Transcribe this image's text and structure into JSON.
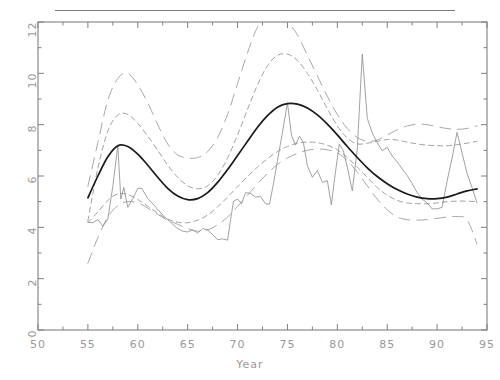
{
  "figure": {
    "top_rule": true,
    "background_color": "#ffffff",
    "frame_color": "#808080",
    "tick_label_color": "#9a9a9a"
  },
  "chart_data": {
    "type": "line",
    "title": "",
    "subtitle": "",
    "xlabel": "Year",
    "ylabel": "",
    "xlim": [
      50,
      95
    ],
    "ylim": [
      0,
      12
    ],
    "xticks": [
      50,
      55,
      60,
      65,
      70,
      75,
      80,
      85,
      90,
      95
    ],
    "xtick_labels": [
      "50",
      "55",
      "60",
      "65",
      "70",
      "75",
      "80",
      "85",
      "90",
      "95"
    ],
    "yticks": [
      0,
      2,
      4,
      6,
      8,
      10,
      12
    ],
    "ytick_labels": [
      "0",
      "2",
      "4",
      "6",
      "8",
      "10",
      "12"
    ],
    "minor_xticks": [
      52.5,
      57.5,
      62.5,
      67.5,
      72.5,
      77.5,
      82.5,
      87.5,
      92.5
    ],
    "minor_yticks": [
      1,
      3,
      5,
      7,
      9,
      11
    ],
    "grid": false,
    "legend": null,
    "series": [
      {
        "name": "smooth trend",
        "style": "solid",
        "color": "#1a1a1a",
        "width": 1.7,
        "x": [
          55,
          56,
          57,
          58,
          59,
          60,
          61,
          62,
          63,
          64,
          65,
          66,
          67,
          68,
          69,
          70,
          71,
          72,
          73,
          74,
          75,
          76,
          77,
          78,
          79,
          80,
          81,
          82,
          83,
          84,
          85,
          86,
          87,
          88,
          89,
          90,
          91,
          92,
          93,
          94
        ],
        "values": [
          5.15,
          6.0,
          6.75,
          7.18,
          7.15,
          6.85,
          6.42,
          5.95,
          5.52,
          5.22,
          5.08,
          5.12,
          5.35,
          5.75,
          6.25,
          6.8,
          7.35,
          7.9,
          8.35,
          8.68,
          8.82,
          8.8,
          8.65,
          8.38,
          8.02,
          7.6,
          7.15,
          6.72,
          6.32,
          5.98,
          5.7,
          5.47,
          5.3,
          5.18,
          5.12,
          5.12,
          5.18,
          5.3,
          5.42,
          5.5
        ]
      },
      {
        "name": "observed data",
        "style": "solid",
        "color": "#8a8a8a",
        "width": 0.8,
        "x": [
          55,
          55.5,
          56,
          56.5,
          57,
          57.5,
          58,
          58.3,
          58.6,
          59,
          59.5,
          60,
          60.4,
          61,
          61.5,
          62,
          62.5,
          63,
          63.5,
          64,
          64.5,
          65,
          65.5,
          66,
          66.5,
          67,
          67.5,
          68,
          68.5,
          69,
          69.3,
          69.6,
          70,
          70.4,
          70.8,
          71.3,
          71.8,
          72.3,
          72.8,
          73.2,
          73.6,
          74,
          74.5,
          75,
          75.4,
          75.8,
          76.2,
          76.6,
          77,
          77.5,
          78,
          78.5,
          79,
          79.4,
          79.8,
          80.2,
          80.6,
          81,
          81.5,
          82,
          82.5,
          83,
          83.5,
          84,
          84.5,
          85,
          85.5,
          86,
          86.5,
          87,
          87.5,
          88,
          88.5,
          89,
          89.5,
          90,
          90.5,
          91,
          91.5,
          92,
          92.5,
          93,
          93.5,
          94
        ],
        "values": [
          4.2,
          4.18,
          4.3,
          4.05,
          4.32,
          5.6,
          7.18,
          5.1,
          5.55,
          4.78,
          5.12,
          5.52,
          5.52,
          5.12,
          4.92,
          4.7,
          4.48,
          4.3,
          4.12,
          3.95,
          3.85,
          3.82,
          3.9,
          3.78,
          3.95,
          3.9,
          3.72,
          3.52,
          3.55,
          3.5,
          4.3,
          5.02,
          5.1,
          4.92,
          5.35,
          5.32,
          5.18,
          5.2,
          4.92,
          4.9,
          5.7,
          6.6,
          7.7,
          8.85,
          7.6,
          7.2,
          7.55,
          7.3,
          6.4,
          5.95,
          6.22,
          5.75,
          5.82,
          4.88,
          6.12,
          7.25,
          6.98,
          6.35,
          5.42,
          7.05,
          10.75,
          8.25,
          7.68,
          7.3,
          6.98,
          7.12,
          6.78,
          6.55,
          6.28,
          6.02,
          5.7,
          5.35,
          5.1,
          4.95,
          4.72,
          4.72,
          4.78,
          5.8,
          6.7,
          7.7,
          6.9,
          6.1,
          5.55,
          4.95
        ]
      },
      {
        "name": "outer band upper",
        "style": "long-dashed",
        "color": "#a8a8a8",
        "width": 1.0,
        "x": [
          55,
          56,
          57,
          58,
          59,
          60,
          61,
          62,
          63,
          64,
          65,
          66,
          67,
          68,
          69,
          70,
          71,
          72,
          73,
          74,
          75,
          76,
          77,
          78,
          79,
          80,
          81,
          82,
          83,
          84,
          85,
          86,
          87,
          88,
          89,
          90,
          91,
          92,
          93,
          94
        ],
        "values": [
          5.6,
          7.3,
          8.95,
          9.8,
          10.0,
          9.55,
          8.85,
          8.0,
          7.25,
          6.82,
          6.7,
          6.72,
          6.95,
          7.5,
          8.4,
          9.6,
          10.8,
          11.8,
          12.2,
          12.25,
          12.0,
          11.5,
          10.7,
          9.9,
          9.1,
          8.4,
          7.85,
          7.5,
          7.35,
          7.4,
          7.6,
          7.8,
          7.95,
          8.02,
          8.0,
          7.92,
          7.85,
          7.82,
          7.85,
          7.95
        ]
      },
      {
        "name": "outer band lower",
        "style": "long-dashed",
        "color": "#a8a8a8",
        "width": 1.0,
        "x": [
          55,
          56,
          57,
          58,
          59,
          60,
          61,
          62,
          63,
          64,
          65,
          66,
          67,
          68,
          69,
          70,
          71,
          72,
          73,
          74,
          75,
          76,
          77,
          78,
          79,
          80,
          81,
          82,
          83,
          84,
          85,
          86,
          87,
          88,
          89,
          90,
          91,
          92,
          93,
          94
        ],
        "values": [
          2.6,
          3.6,
          4.4,
          4.85,
          5.0,
          4.95,
          4.75,
          4.5,
          4.28,
          4.12,
          3.95,
          3.85,
          3.9,
          4.1,
          4.4,
          4.82,
          5.25,
          5.7,
          6.1,
          6.45,
          6.7,
          6.88,
          7.0,
          7.05,
          7.02,
          6.9,
          6.6,
          6.15,
          5.62,
          5.1,
          4.68,
          4.4,
          4.3,
          4.28,
          4.3,
          4.35,
          4.4,
          4.42,
          4.3,
          3.35
        ]
      },
      {
        "name": "inner band upper",
        "style": "short-dashed",
        "color": "#a0a0a0",
        "width": 1.0,
        "x": [
          55,
          56,
          57,
          58,
          59,
          60,
          61,
          62,
          63,
          64,
          65,
          66,
          67,
          68,
          69,
          70,
          71,
          72,
          73,
          74,
          75,
          76,
          77,
          78,
          79,
          80,
          81,
          82,
          83,
          84,
          85,
          86,
          87,
          88,
          89,
          90,
          91,
          92,
          93,
          94
        ],
        "values": [
          4.25,
          6.3,
          7.75,
          8.38,
          8.4,
          8.05,
          7.55,
          7.0,
          6.42,
          5.95,
          5.62,
          5.5,
          5.62,
          6.02,
          6.7,
          7.6,
          8.6,
          9.55,
          10.3,
          10.7,
          10.75,
          10.5,
          10.0,
          9.35,
          8.62,
          7.95,
          7.48,
          7.25,
          7.28,
          7.35,
          7.42,
          7.4,
          7.32,
          7.25,
          7.2,
          7.18,
          7.18,
          7.22,
          7.28,
          7.35
        ]
      },
      {
        "name": "inner band lower",
        "style": "short-dashed",
        "color": "#a0a0a0",
        "width": 1.0,
        "x": [
          55,
          56,
          57,
          58,
          59,
          60,
          61,
          62,
          63,
          64,
          65,
          66,
          67,
          68,
          69,
          70,
          71,
          72,
          73,
          74,
          75,
          76,
          77,
          78,
          79,
          80,
          81,
          82,
          83,
          84,
          85,
          86,
          87,
          88,
          89,
          90,
          91,
          92,
          93,
          94
        ],
        "values": [
          4.18,
          4.6,
          5.05,
          5.3,
          5.28,
          5.08,
          4.82,
          4.55,
          4.32,
          4.2,
          4.18,
          4.28,
          4.48,
          4.8,
          5.18,
          5.58,
          5.98,
          6.35,
          6.68,
          6.95,
          7.15,
          7.28,
          7.32,
          7.3,
          7.2,
          7.02,
          6.72,
          6.35,
          5.95,
          5.55,
          5.25,
          5.05,
          4.95,
          4.92,
          4.92,
          4.95,
          5.0,
          5.02,
          5.02,
          5.0
        ]
      }
    ]
  }
}
